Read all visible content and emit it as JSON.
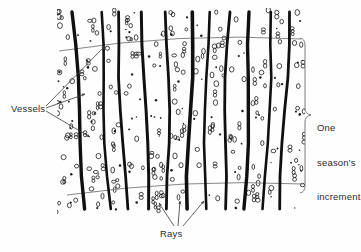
{
  "figure": {
    "type": "wood-anatomy-diagram",
    "title": "",
    "background_color": "#fefefe",
    "ink_color": "#141414",
    "line_color": "#6b6b6b",
    "labels": {
      "vessels": "Vessels",
      "rays": "Rays",
      "season_line1": "One",
      "season_line2": "season's",
      "season_line3": "increment"
    }
  },
  "annotations": {
    "vessels": {
      "label": "Vessels",
      "text_x": 11,
      "text_y": 103,
      "arrow_count": 3,
      "arrow_targets": [
        [
          108,
          44
        ],
        [
          88,
          93
        ],
        [
          93,
          138
        ]
      ]
    },
    "rays": {
      "label": "Rays",
      "text_x": 160,
      "text_y": 228,
      "arrow_count": 3,
      "arrow_targets": [
        [
          160,
          202
        ],
        [
          180,
          199
        ],
        [
          205,
          199
        ]
      ]
    },
    "season_bracket": {
      "label_lines": [
        "One",
        "season's",
        "increment"
      ],
      "brace_x": 306,
      "brace_top_y": 38,
      "brace_bottom_y": 193,
      "text_x": 317,
      "text_y": 99
    }
  },
  "chart_data": {
    "type": "diagram",
    "ray_lines": [
      {
        "x_top": 72,
        "x_bottom": 86,
        "width": 3.4
      },
      {
        "x_top": 100,
        "x_bottom": 110,
        "width": 2.6
      },
      {
        "x_top": 118,
        "x_bottom": 126,
        "width": 2.8
      },
      {
        "x_top": 143,
        "x_bottom": 148,
        "width": 3.0
      },
      {
        "x_top": 167,
        "x_bottom": 168,
        "width": 2.8
      },
      {
        "x_top": 192,
        "x_bottom": 188,
        "width": 3.6
      },
      {
        "x_top": 208,
        "x_bottom": 205,
        "width": 2.6
      },
      {
        "x_top": 229,
        "x_bottom": 224,
        "width": 2.8
      },
      {
        "x_top": 251,
        "x_bottom": 244,
        "width": 3.4
      },
      {
        "x_top": 272,
        "x_bottom": 264,
        "width": 2.6
      },
      {
        "x_top": 289,
        "x_bottom": 281,
        "width": 2.8
      }
    ],
    "boundary_arcs": [
      {
        "name": "upper-increment-boundary",
        "x_start": 59,
        "y_start": 51,
        "x_end": 301,
        "y_end": 39,
        "sag": -13
      },
      {
        "name": "lower-increment-boundary",
        "x_start": 67,
        "y_start": 195,
        "x_end": 303,
        "y_end": 184,
        "sag": -11
      }
    ],
    "ray_top_y": 12,
    "ray_bottom_y": 209,
    "vessel_marker_types": [
      "ellipse-open",
      "ellipse-open-pair",
      "dot-filled"
    ],
    "vessel_count_approx": 300,
    "xlim": [
      55,
      305
    ],
    "ylim": [
      10,
      212
    ]
  }
}
